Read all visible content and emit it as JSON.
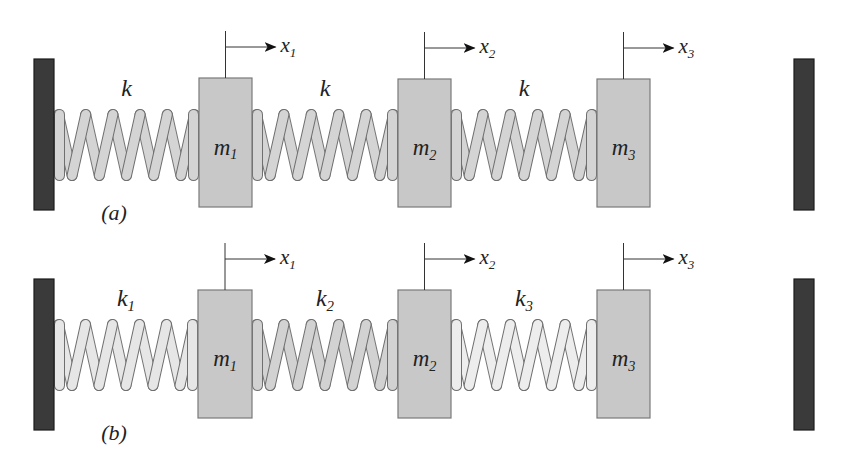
{
  "diagram": {
    "type": "spring-mass system",
    "colors": {
      "wall": "#3a3a3a",
      "mass": "#c8c8c8",
      "mass_border": "#7a7a7a",
      "line": "#333333"
    },
    "systems": [
      {
        "case_label": "(a)",
        "wall_left": {
          "x": 34,
          "y": 59,
          "w": 20,
          "h": 151
        },
        "wall_right": {
          "x": 794,
          "y": 59,
          "w": 20,
          "h": 151
        },
        "spring_y_top": 110,
        "spring_y_bottom": 180,
        "springs": [
          {
            "label": "k",
            "sub": "",
            "x0": 54,
            "x1": 199,
            "fill": "#d4d4d4"
          },
          {
            "label": "k",
            "sub": "",
            "x0": 252,
            "x1": 398,
            "fill": "#d4d4d4"
          },
          {
            "label": "k",
            "sub": "",
            "x0": 451,
            "x1": 597,
            "fill": "#d4d4d4"
          }
        ],
        "masses": [
          {
            "label": "m",
            "sub": "1",
            "x": 199,
            "y": 78,
            "w": 53,
            "h": 129,
            "disp": "x",
            "disp_sub": "1"
          },
          {
            "label": "m",
            "sub": "2",
            "x": 398,
            "y": 79,
            "w": 53,
            "h": 128,
            "disp": "x",
            "disp_sub": "2"
          },
          {
            "label": "m",
            "sub": "3",
            "x": 597,
            "y": 79,
            "w": 53,
            "h": 128,
            "disp": "x",
            "disp_sub": "3"
          }
        ]
      },
      {
        "case_label": "(b)",
        "wall_left": {
          "x": 34,
          "y": 279,
          "w": 20,
          "h": 151
        },
        "wall_right": {
          "x": 794,
          "y": 279,
          "w": 20,
          "h": 151
        },
        "spring_y_top": 320,
        "spring_y_bottom": 390,
        "springs": [
          {
            "label": "k",
            "sub": "1",
            "x0": 54,
            "x1": 198,
            "fill": "#e6e6e6"
          },
          {
            "label": "k",
            "sub": "2",
            "x0": 252,
            "x1": 398,
            "fill": "#d2d2d2"
          },
          {
            "label": "k",
            "sub": "3",
            "x0": 451,
            "x1": 597,
            "fill": "#ededed"
          }
        ],
        "masses": [
          {
            "label": "m",
            "sub": "1",
            "x": 198,
            "y": 290,
            "w": 54,
            "h": 128,
            "disp": "x",
            "disp_sub": "1"
          },
          {
            "label": "m",
            "sub": "2",
            "x": 398,
            "y": 290,
            "w": 53,
            "h": 128,
            "disp": "x",
            "disp_sub": "2"
          },
          {
            "label": "m",
            "sub": "3",
            "x": 597,
            "y": 290,
            "w": 53,
            "h": 128,
            "disp": "x",
            "disp_sub": "3"
          }
        ]
      }
    ]
  }
}
